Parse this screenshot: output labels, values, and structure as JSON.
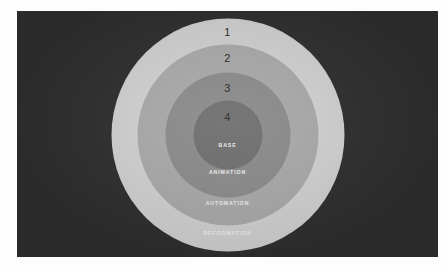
{
  "figure": {
    "background_color": "#2f2f2f",
    "frame_color": "#fdfdfd",
    "type": "concentric-ring-diagram"
  },
  "chart_data": {
    "type": "pie",
    "title": "",
    "subtitle": "",
    "xlabel": "",
    "ylabel": "",
    "legend_position": "none",
    "grid": false,
    "categories": [
      "DEFORMATION",
      "AUTOMATION",
      "ANIMATION",
      "BASE"
    ],
    "values": [
      233,
      181,
      125,
      69
    ],
    "series": [
      {
        "name": "ring diameter (px)",
        "values": [
          233,
          181,
          125,
          69
        ]
      }
    ],
    "rings": [
      {
        "number": "1",
        "label": "DEFORMATION",
        "color": "#d3d3d3",
        "diameter": 233
      },
      {
        "number": "2",
        "label": "AUTOMATION",
        "color": "#ababab",
        "diameter": 181
      },
      {
        "number": "3",
        "label": "ANIMATION",
        "color": "#8c8c8c",
        "diameter": 125
      },
      {
        "number": "4",
        "label": "BASE",
        "color": "#707070",
        "diameter": 69
      }
    ]
  }
}
